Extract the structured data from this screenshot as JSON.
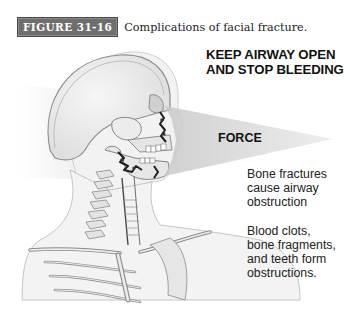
{
  "figure": {
    "label": "FIGURE 31-16",
    "title": "Complications of facial fracture."
  },
  "annotations": {
    "headline_line1": "KEEP AIRWAY OPEN",
    "headline_line2": "AND STOP BLEEDING",
    "force": "FORCE",
    "note1_line1": "Bone fractures",
    "note1_line2": "cause airway",
    "note1_line3": "obstruction",
    "note2_line1": "Blood clots,",
    "note2_line2": "bone fragments,",
    "note2_line3": "and teeth form",
    "note2_line4": "obstructions."
  },
  "illustration": {
    "subject": "lateral view of skull, cervical spine and upper ribs with facial fractures",
    "colors": {
      "bone": "#e9e9e9",
      "outline": "#8c8c8c",
      "fracture": "#2a2a2a",
      "force_wedge": "#d4d4d4",
      "label_bg": "#6e6e6e"
    }
  }
}
